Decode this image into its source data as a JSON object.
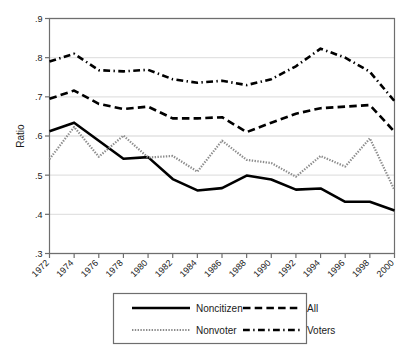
{
  "chart_data": {
    "type": "line",
    "title": "",
    "xlabel": "",
    "ylabel": "Ratio",
    "x": [
      1972,
      1974,
      1976,
      1978,
      1980,
      1982,
      1984,
      1986,
      1988,
      1990,
      1992,
      1994,
      1996,
      1998,
      2000
    ],
    "xtick_labels": [
      "1972",
      "1974",
      "1976",
      "1978",
      "1980",
      "1982",
      "1984",
      "1986",
      "1988",
      "1990",
      "1992",
      "1994",
      "1996",
      "1998",
      "2000"
    ],
    "ytick_labels": [
      ".3",
      ".4",
      ".5",
      ".6",
      ".7",
      ".8",
      ".9"
    ],
    "ytick_values": [
      0.3,
      0.4,
      0.5,
      0.6,
      0.7,
      0.8,
      0.9
    ],
    "xlim": [
      1972,
      2000
    ],
    "ylim": [
      0.3,
      0.9
    ],
    "grid": "horizontal",
    "legend_position": "below-axes",
    "series": [
      {
        "name": "Noncitizen",
        "style": "solid",
        "color": "#000000",
        "width": 2.6,
        "values": [
          0.612,
          0.634,
          0.588,
          0.542,
          0.546,
          0.49,
          0.461,
          0.467,
          0.499,
          0.489,
          0.463,
          0.466,
          0.432,
          0.432,
          0.41
        ]
      },
      {
        "name": "All",
        "style": "dashed",
        "color": "#000000",
        "width": 2.6,
        "values": [
          0.695,
          0.716,
          0.682,
          0.669,
          0.675,
          0.645,
          0.645,
          0.648,
          0.61,
          0.634,
          0.657,
          0.671,
          0.675,
          0.679,
          0.611
        ]
      },
      {
        "name": "Nonvoter",
        "style": "dotted",
        "color": "#8c8c8c",
        "width": 2.2,
        "values": [
          0.541,
          0.623,
          0.547,
          0.601,
          0.545,
          0.549,
          0.509,
          0.588,
          0.539,
          0.531,
          0.496,
          0.549,
          0.522,
          0.594,
          0.462
        ]
      },
      {
        "name": "Voters",
        "style": "dashdot",
        "color": "#000000",
        "width": 2.6,
        "values": [
          0.79,
          0.81,
          0.768,
          0.765,
          0.769,
          0.745,
          0.736,
          0.741,
          0.73,
          0.745,
          0.778,
          0.823,
          0.8,
          0.764,
          0.689
        ]
      }
    ],
    "legend_entries": [
      {
        "label": "Noncitizen",
        "style": "solid"
      },
      {
        "label": "All",
        "style": "dashed"
      },
      {
        "label": "Nonvoter",
        "style": "dotted"
      },
      {
        "label": "Voters",
        "style": "dashdot"
      }
    ]
  }
}
